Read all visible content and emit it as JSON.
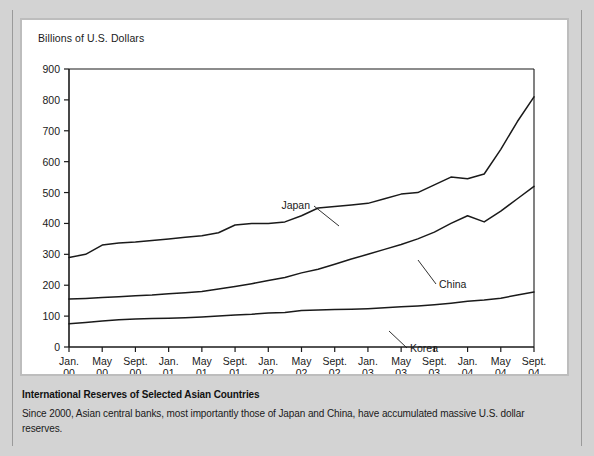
{
  "figure": {
    "axis_title": "Billions of U.S. Dollars",
    "caption_title": "International Reserves of Selected Asian Countries",
    "caption_body": "Since 2000, Asian central banks, most importantly those of Japan and China, have accumulated massive U.S. dollar reserves."
  },
  "chart_data": {
    "type": "line",
    "title": "International Reserves of Selected Asian Countries",
    "subtitle": "Since 2000, Asian central banks, most importantly those of Japan and China, have accumulated massive U.S. dollar reserves.",
    "xlabel": "",
    "ylabel": "Billions of U.S. Dollars",
    "ylim": [
      0,
      900
    ],
    "yticks": [
      0,
      100,
      200,
      300,
      400,
      500,
      600,
      700,
      800,
      900
    ],
    "grid": false,
    "legend": "inline-labels",
    "categories": [
      "Jan. 00",
      "May 00",
      "Sept. 00",
      "Jan. 01",
      "May 01",
      "Sept. 01",
      "Jan. 02",
      "May 02",
      "Sept. 02",
      "Jan. 03",
      "May 03",
      "Sept. 03",
      "Jan. 04",
      "May 04",
      "Sept. 04"
    ],
    "xtick_labels": [
      {
        "month": "Jan.",
        "year": "00"
      },
      {
        "month": "May",
        "year": "00"
      },
      {
        "month": "Sept.",
        "year": "00"
      },
      {
        "month": "Jan.",
        "year": "01"
      },
      {
        "month": "May",
        "year": "01"
      },
      {
        "month": "Sept.",
        "year": "01"
      },
      {
        "month": "Jan.",
        "year": "02"
      },
      {
        "month": "May",
        "year": "02"
      },
      {
        "month": "Sept.",
        "year": "02"
      },
      {
        "month": "Jan.",
        "year": "03"
      },
      {
        "month": "May",
        "year": "03"
      },
      {
        "month": "Sept.",
        "year": "03"
      },
      {
        "month": "Jan.",
        "year": "04"
      },
      {
        "month": "May",
        "year": "04"
      },
      {
        "month": "Sept.",
        "year": "04"
      }
    ],
    "series": [
      {
        "name": "Japan",
        "color": "#1a1a1a",
        "x": [
          0,
          0.5,
          1,
          1.5,
          2,
          2.5,
          3,
          3.5,
          4,
          4.5,
          5,
          5.5,
          6,
          6.5,
          7,
          7.5,
          8,
          8.5,
          9,
          9.5,
          10,
          10.5,
          11,
          11.5,
          12,
          12.5,
          13,
          13.5,
          14
        ],
        "values": [
          290,
          300,
          330,
          337,
          340,
          345,
          350,
          355,
          360,
          370,
          395,
          400,
          400,
          405,
          425,
          450,
          455,
          460,
          465,
          480,
          495,
          500,
          525,
          550,
          545,
          560,
          640,
          730,
          810
        ]
      },
      {
        "name": "China",
        "color": "#1a1a1a",
        "x": [
          0,
          0.5,
          1,
          1.5,
          2,
          2.5,
          3,
          3.5,
          4,
          4.5,
          5,
          5.5,
          6,
          6.5,
          7,
          7.5,
          8,
          8.5,
          9,
          9.5,
          10,
          10.5,
          11,
          11.5,
          12,
          12.5,
          13,
          13.5,
          14
        ],
        "values": [
          155,
          157,
          160,
          163,
          166,
          168,
          172,
          176,
          180,
          188,
          196,
          205,
          215,
          225,
          240,
          252,
          268,
          285,
          300,
          316,
          332,
          350,
          372,
          400,
          425,
          405,
          440,
          480,
          520
        ]
      },
      {
        "name": "Korea",
        "color": "#1a1a1a",
        "x": [
          0,
          0.5,
          1,
          1.5,
          2,
          2.5,
          3,
          3.5,
          4,
          4.5,
          5,
          5.5,
          6,
          6.5,
          7,
          7.5,
          8,
          8.5,
          9,
          9.5,
          10,
          10.5,
          11,
          11.5,
          12,
          12.5,
          13,
          13.5,
          14
        ],
        "values": [
          75,
          79,
          84,
          88,
          91,
          92,
          93,
          95,
          97,
          100,
          104,
          106,
          110,
          112,
          118,
          120,
          121,
          122,
          124,
          127,
          130,
          133,
          137,
          142,
          148,
          152,
          158,
          168,
          178
        ]
      }
    ],
    "annotations": [
      {
        "text": "Japan",
        "series": "Japan"
      },
      {
        "text": "China",
        "series": "China"
      },
      {
        "text": "Korea",
        "series": "Korea"
      }
    ]
  }
}
